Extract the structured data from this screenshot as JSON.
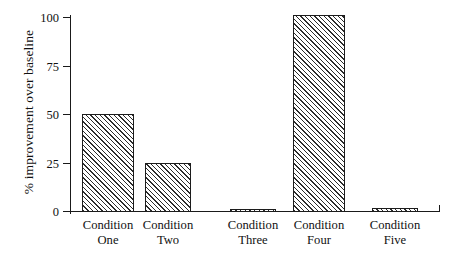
{
  "chart_data": {
    "type": "bar",
    "title": "",
    "xlabel": "",
    "ylabel": "% improvement over baseline",
    "categories": [
      "Condition One",
      "Condition Two",
      "Condition Three",
      "Condition Four",
      "Condition Five"
    ],
    "category_lines": [
      {
        "line1": "Condition",
        "line2": "One"
      },
      {
        "line1": "Condition",
        "line2": "Two"
      },
      {
        "line1": "Condition",
        "line2": "Three"
      },
      {
        "line1": "Condition",
        "line2": "Four"
      },
      {
        "line1": "Condition",
        "line2": "Five"
      }
    ],
    "values": [
      50.5,
      25.5,
      1.8,
      101.5,
      2.0
    ],
    "ylim": [
      0,
      100
    ],
    "yticks": [
      0,
      25,
      50,
      75,
      100
    ],
    "ytick_labels": [
      "0",
      "25",
      "50",
      "75",
      "100"
    ],
    "grid": false,
    "legend": null,
    "bar_fill": "diagonal-hatch",
    "bar_edge_color": "#1c1c1c",
    "axis_color": "#1a1a1a",
    "background": "#ffffff"
  },
  "layout": {
    "bar_px_left": [
      12,
      75,
      160,
      223,
      302
    ],
    "bar_px_width": [
      52,
      46,
      46,
      52,
      46
    ],
    "cat_px_center": [
      38,
      98,
      183,
      249,
      325
    ]
  }
}
